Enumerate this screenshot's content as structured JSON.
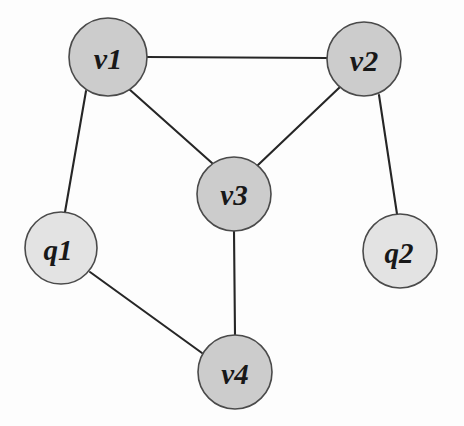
{
  "diagram": {
    "width": 464,
    "height": 426,
    "background_color": "#fdfdfd",
    "edge_color": "#262626",
    "node_border_color": "#4a4a4a",
    "label_color": "#181818",
    "node_fill_vertex": "#cccccc",
    "node_fill_query": "#e3e3e3"
  },
  "chart_data": {
    "type": "graph",
    "title": "",
    "directed": false,
    "node_count": 6,
    "edge_count": 7,
    "nodes": [
      {
        "id": "v1",
        "label": "v1",
        "x": 108,
        "y": 57,
        "r": 39,
        "fill": "#cccccc",
        "group": "vertex",
        "label_dx": 0,
        "label_dy": 1,
        "font_size": 30
      },
      {
        "id": "v2",
        "label": "v2",
        "x": 364,
        "y": 59,
        "r": 37,
        "fill": "#cccccc",
        "group": "vertex",
        "label_dx": 0,
        "label_dy": 1,
        "font_size": 30
      },
      {
        "id": "v3",
        "label": "v3",
        "x": 234,
        "y": 194,
        "r": 37,
        "fill": "#cccccc",
        "group": "vertex",
        "label_dx": 0,
        "label_dy": 1,
        "font_size": 29
      },
      {
        "id": "v4",
        "label": "v4",
        "x": 235,
        "y": 372,
        "r": 37,
        "fill": "#cccccc",
        "group": "vertex",
        "label_dx": 0,
        "label_dy": 2,
        "font_size": 29
      },
      {
        "id": "q1",
        "label": "q1",
        "x": 61,
        "y": 248,
        "r": 36,
        "fill": "#e3e3e3",
        "group": "query",
        "label_dx": -3,
        "label_dy": 2,
        "font_size": 29
      },
      {
        "id": "q2",
        "label": "q2",
        "x": 400,
        "y": 251,
        "r": 37,
        "fill": "#e3e3e3",
        "group": "query",
        "label_dx": -1,
        "label_dy": 2,
        "font_size": 29
      }
    ],
    "edges": [
      {
        "id": "e-v1-v2",
        "source": "v1",
        "target": "v2",
        "x1": 146,
        "y1": 57,
        "x2": 327,
        "y2": 58
      },
      {
        "id": "e-v1-v3",
        "source": "v1",
        "target": "v3",
        "x1": 129,
        "y1": 89,
        "x2": 212,
        "y2": 163
      },
      {
        "id": "e-v1-q1",
        "source": "v1",
        "target": "q1",
        "x1": 86,
        "y1": 91,
        "x2": 65,
        "y2": 212
      },
      {
        "id": "e-v2-v3",
        "source": "v2",
        "target": "v3",
        "x1": 340,
        "y1": 87,
        "x2": 258,
        "y2": 165
      },
      {
        "id": "e-v2-q2",
        "source": "v2",
        "target": "q2",
        "x1": 379,
        "y1": 95,
        "x2": 397,
        "y2": 214
      },
      {
        "id": "e-v3-v4",
        "source": "v3",
        "target": "v4",
        "x1": 234,
        "y1": 231,
        "x2": 235,
        "y2": 335
      },
      {
        "id": "e-q1-v4",
        "source": "q1",
        "target": "v4",
        "x1": 90,
        "y1": 272,
        "x2": 202,
        "y2": 353
      }
    ],
    "adjacency": {
      "v1": [
        "v2",
        "v3",
        "q1"
      ],
      "v2": [
        "v1",
        "v3",
        "q2"
      ],
      "v3": [
        "v1",
        "v2",
        "v4"
      ],
      "v4": [
        "v3",
        "q1"
      ],
      "q1": [
        "v1",
        "v4"
      ],
      "q2": [
        "v2"
      ]
    },
    "legend": []
  }
}
